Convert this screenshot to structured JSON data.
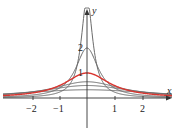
{
  "chart_data": {
    "type": "line",
    "title": "",
    "xlabel": "x",
    "ylabel": "y",
    "x_ticks": [
      -2,
      -1,
      1,
      2
    ],
    "x_tick_labels": [
      "−2",
      "−1",
      "1",
      "2"
    ],
    "y_tick_labels": [
      "1",
      "2"
    ],
    "xlim": [
      -3.1,
      3.0
    ],
    "ylim": [
      -1.2,
      3.9
    ],
    "grid": false,
    "legend": "none",
    "series": [
      {
        "name": "c=0.33",
        "peak": 0.33,
        "color": "#6b6b6b"
      },
      {
        "name": "c=0.5",
        "peak": 0.5,
        "color": "#6b6b6b"
      },
      {
        "name": "c=0.65",
        "peak": 0.65,
        "color": "#6b6b6b"
      },
      {
        "name": "c=1",
        "peak": 1.0,
        "color": "#d9352f",
        "highlighted": true
      },
      {
        "name": "c=2",
        "peak": 2.0,
        "color": "#6b6b6b"
      },
      {
        "name": "c=4",
        "peak": 4.0,
        "color": "#6b6b6b",
        "clipped": true
      }
    ]
  },
  "labels": {
    "x_axis": "x",
    "y_axis": "y",
    "t_neg2": "−2",
    "t_neg1": "−1",
    "t_1": "1",
    "t_2": "2",
    "y1": "1",
    "y2": "2"
  }
}
